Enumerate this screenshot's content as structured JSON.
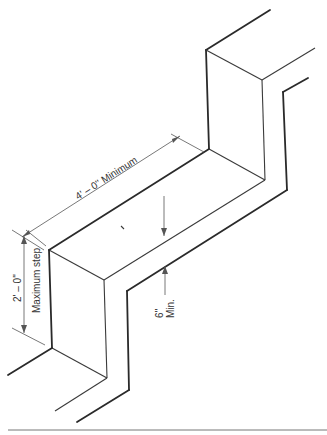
{
  "diagram": {
    "type": "isometric-stair-step-detail",
    "labels": {
      "tread_length": "4' – 0'' Minimum",
      "riser_height": "2' – 0''",
      "riser_note": "Maximum step",
      "thickness_value": "6''",
      "thickness_note": "Min."
    },
    "colors": {
      "line": "#2a2a2a",
      "dimension": "#555555",
      "background": "#ffffff"
    }
  }
}
